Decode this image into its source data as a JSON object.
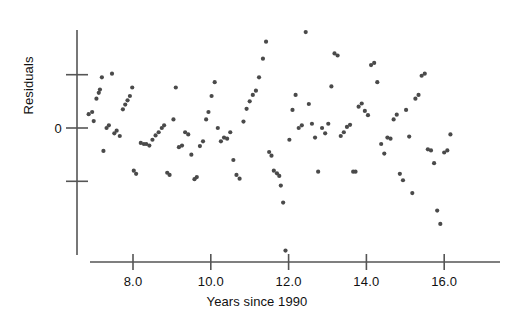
{
  "chart_data": {
    "type": "scatter",
    "title": "",
    "xlabel": "Years since 1990",
    "ylabel": "Residuals",
    "grid": false,
    "legend": null,
    "xlim": [
      6.6,
      17.0
    ],
    "ylim": [
      -2.6,
      1.85
    ],
    "x_ticks": [
      8.0,
      10.0,
      12.0,
      14.0,
      16.0
    ],
    "x_tick_labels": [
      "8.0",
      "10.0",
      "12.0",
      "14.0",
      "16.0"
    ],
    "y_ticks": [
      1.0,
      0.0,
      -1.0
    ],
    "y_tick_labels": [
      "",
      "0",
      ""
    ],
    "marker": {
      "shape": "circle",
      "color": "#4a4a4a",
      "size_px": 4.2
    },
    "axis_color": "#555555",
    "background_color": "#ffffff",
    "series": [
      {
        "name": "residuals",
        "points": [
          [
            6.86,
            0.26
          ],
          [
            6.95,
            0.3
          ],
          [
            6.99,
            0.13
          ],
          [
            7.06,
            0.55
          ],
          [
            7.12,
            0.66
          ],
          [
            7.15,
            0.72
          ],
          [
            7.2,
            0.95
          ],
          [
            7.24,
            -0.43
          ],
          [
            7.32,
            0.0
          ],
          [
            7.38,
            0.05
          ],
          [
            7.46,
            1.02
          ],
          [
            7.52,
            -0.1
          ],
          [
            7.58,
            -0.05
          ],
          [
            7.66,
            -0.15
          ],
          [
            7.74,
            0.35
          ],
          [
            7.8,
            0.44
          ],
          [
            7.86,
            0.52
          ],
          [
            7.92,
            0.6
          ],
          [
            7.98,
            0.76
          ],
          [
            8.02,
            -0.8
          ],
          [
            8.08,
            -0.86
          ],
          [
            8.2,
            -0.28
          ],
          [
            8.28,
            -0.3
          ],
          [
            8.34,
            -0.3
          ],
          [
            8.42,
            -0.33
          ],
          [
            8.5,
            -0.22
          ],
          [
            8.58,
            -0.14
          ],
          [
            8.66,
            -0.08
          ],
          [
            8.74,
            0.0
          ],
          [
            8.8,
            0.05
          ],
          [
            8.88,
            -0.84
          ],
          [
            8.94,
            -0.88
          ],
          [
            9.04,
            0.16
          ],
          [
            9.1,
            0.76
          ],
          [
            9.18,
            -0.36
          ],
          [
            9.26,
            -0.33
          ],
          [
            9.34,
            -0.08
          ],
          [
            9.42,
            -0.12
          ],
          [
            9.5,
            -0.5
          ],
          [
            9.58,
            -0.96
          ],
          [
            9.64,
            -0.92
          ],
          [
            9.72,
            -0.34
          ],
          [
            9.8,
            -0.25
          ],
          [
            9.88,
            0.16
          ],
          [
            9.94,
            0.3
          ],
          [
            10.02,
            0.6
          ],
          [
            10.1,
            0.86
          ],
          [
            10.18,
            0.0
          ],
          [
            10.26,
            -0.25
          ],
          [
            10.34,
            -0.18
          ],
          [
            10.42,
            -0.2
          ],
          [
            10.5,
            -0.08
          ],
          [
            10.58,
            -0.6
          ],
          [
            10.66,
            -0.88
          ],
          [
            10.74,
            -0.95
          ],
          [
            10.84,
            0.12
          ],
          [
            10.92,
            0.36
          ],
          [
            11.0,
            0.5
          ],
          [
            11.08,
            0.62
          ],
          [
            11.16,
            0.7
          ],
          [
            11.24,
            0.95
          ],
          [
            11.34,
            1.3
          ],
          [
            11.42,
            1.62
          ],
          [
            11.5,
            -0.45
          ],
          [
            11.56,
            -0.52
          ],
          [
            11.62,
            -0.8
          ],
          [
            11.7,
            -0.85
          ],
          [
            11.76,
            -0.9
          ],
          [
            11.8,
            -1.08
          ],
          [
            11.86,
            -1.4
          ],
          [
            11.92,
            -2.3
          ],
          [
            12.02,
            -0.22
          ],
          [
            12.1,
            0.34
          ],
          [
            12.18,
            0.62
          ],
          [
            12.26,
            0.0
          ],
          [
            12.34,
            0.05
          ],
          [
            12.44,
            1.8
          ],
          [
            12.52,
            0.45
          ],
          [
            12.6,
            0.08
          ],
          [
            12.68,
            -0.18
          ],
          [
            12.76,
            -0.82
          ],
          [
            12.86,
            0.0
          ],
          [
            12.94,
            -0.1
          ],
          [
            13.02,
            0.08
          ],
          [
            13.1,
            0.78
          ],
          [
            13.18,
            1.4
          ],
          [
            13.26,
            1.36
          ],
          [
            13.34,
            -0.15
          ],
          [
            13.42,
            -0.08
          ],
          [
            13.5,
            0.02
          ],
          [
            13.58,
            0.06
          ],
          [
            13.66,
            -0.82
          ],
          [
            13.72,
            -0.82
          ],
          [
            13.8,
            0.4
          ],
          [
            13.88,
            0.46
          ],
          [
            13.96,
            0.32
          ],
          [
            14.04,
            0.24
          ],
          [
            14.12,
            1.18
          ],
          [
            14.2,
            1.22
          ],
          [
            14.28,
            0.86
          ],
          [
            14.38,
            -0.3
          ],
          [
            14.46,
            -0.48
          ],
          [
            14.54,
            -0.18
          ],
          [
            14.62,
            -0.2
          ],
          [
            14.7,
            0.16
          ],
          [
            14.78,
            0.25
          ],
          [
            14.86,
            -0.86
          ],
          [
            14.94,
            -0.98
          ],
          [
            15.02,
            0.34
          ],
          [
            15.1,
            -0.16
          ],
          [
            15.18,
            -1.22
          ],
          [
            15.26,
            0.55
          ],
          [
            15.34,
            0.62
          ],
          [
            15.42,
            0.98
          ],
          [
            15.5,
            1.02
          ],
          [
            15.58,
            -0.4
          ],
          [
            15.66,
            -0.42
          ],
          [
            15.74,
            -0.66
          ],
          [
            15.82,
            -1.55
          ],
          [
            15.9,
            -1.8
          ],
          [
            16.0,
            -0.46
          ],
          [
            16.08,
            -0.42
          ],
          [
            16.16,
            -0.12
          ]
        ]
      }
    ]
  },
  "axes": {
    "x_axis_title": "Years since 1990",
    "y_axis_title": "Residuals",
    "x_tick_labels": [
      "8.0",
      "10.0",
      "12.0",
      "14.0",
      "16.0"
    ],
    "y_tick_labels": [
      "0"
    ]
  }
}
